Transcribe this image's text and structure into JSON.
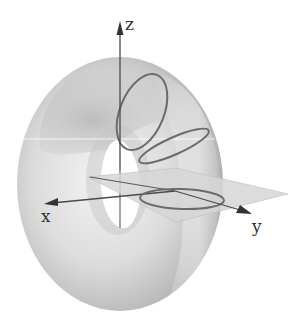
{
  "figure": {
    "axes": {
      "x_label": "x",
      "y_label": "y",
      "z_label": "z"
    },
    "colors": {
      "background": "#ffffff",
      "torus_light": "#f2f2f2",
      "torus_mid": "#c8c8c8",
      "torus_dark": "#9a9a9a",
      "plane_fill": "#d9d9d9",
      "curve_stroke": "#6b6b6b",
      "axis_stroke": "#4a4a4a"
    },
    "curves": [
      {
        "name": "vertical-cross-section-circle"
      },
      {
        "name": "tilted-cross-section-circle"
      },
      {
        "name": "horizontal-cross-section-circle"
      }
    ]
  }
}
